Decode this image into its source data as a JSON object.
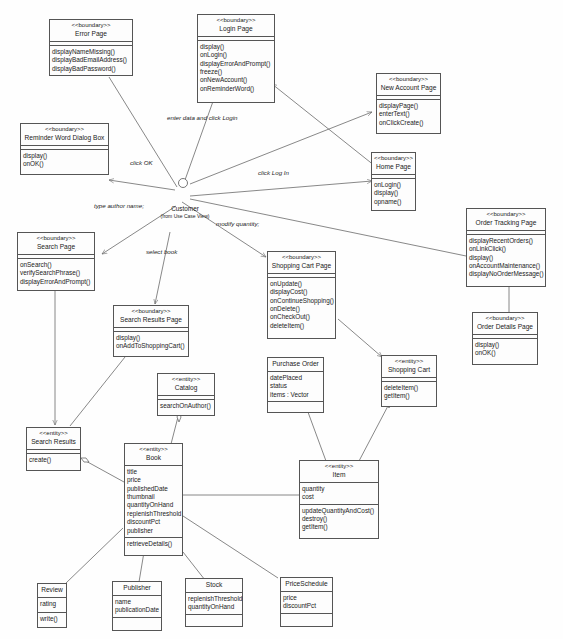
{
  "actor": {
    "name": "Customer",
    "subtitle": "(from Use Case View)"
  },
  "classes": {
    "error_page": {
      "stereotype": "<<boundary>>",
      "name": "Error Page",
      "operations": [
        "displayNameMissing()",
        "displayBadEmailAddress()",
        "displayBadPassword()"
      ]
    },
    "login_page": {
      "stereotype": "<<boundary>>",
      "name": "Login Page",
      "operations": [
        "display()",
        "onLogin()",
        "displayErrorAndPrompt()",
        "freeze()",
        "onNewAccount()",
        "onReminderWord()"
      ]
    },
    "new_account_page": {
      "stereotype": "<<boundary>>",
      "name": "New Account Page",
      "operations": [
        "displayPage()",
        "enterText()",
        "onClickCreate()"
      ]
    },
    "reminder_word_dialog": {
      "stereotype": "<<boundary>>",
      "name": "Reminder Word Dialog Box",
      "operations": [
        "display()",
        "onOK()"
      ]
    },
    "home_page": {
      "stereotype": "<<boundary>>",
      "name": "Home Page",
      "operations": [
        "onLogin()",
        "display()",
        "opname()"
      ]
    },
    "order_tracking_page": {
      "stereotype": "<<boundary>>",
      "name": "Order Tracking Page",
      "operations": [
        "displayRecentOrders()",
        "onLinkClick()",
        "display()",
        "onAccountMaintenance()",
        "displayNoOrderMessage()"
      ]
    },
    "search_page": {
      "stereotype": "<<boundary>>",
      "name": "Search Page",
      "operations": [
        "onSearch()",
        "verifySearchPhrase()",
        "displayErrorAndPrompt()"
      ]
    },
    "shopping_cart_page": {
      "stereotype": "<<boundary>>",
      "name": "Shopping Cart Page",
      "operations": [
        "onUpdate()",
        "displayCost()",
        "onContinueShopping()",
        "onDelete()",
        "onCheckOut()",
        "deleteItem()"
      ]
    },
    "search_results_page": {
      "stereotype": "<<boundary>>",
      "name": "Search Results Page",
      "operations": [
        "display()",
        "onAddToShoppingCart()"
      ]
    },
    "order_details_page": {
      "stereotype": "<<boundary>>",
      "name": "Order Details Page",
      "operations": [
        "display()",
        "onOK()"
      ]
    },
    "catalog": {
      "stereotype": "<<entity>>",
      "name": "Catalog",
      "operations": [
        "searchOnAuthor()"
      ]
    },
    "purchase_order": {
      "name": "Purchase Order",
      "attributes": [
        "datePlaced",
        "status",
        "items : Vector"
      ]
    },
    "shopping_cart": {
      "stereotype": "<<entity>>",
      "name": "Shopping Cart",
      "operations": [
        "deleteItem()",
        "getItem()"
      ]
    },
    "search_results": {
      "stereotype": "<<entity>>",
      "name": "Search Results",
      "operations": [
        "create()"
      ]
    },
    "book": {
      "stereotype": "<<entity>>",
      "name": "Book",
      "attributes": [
        "title",
        "price",
        "publishedDate",
        "thumbnail",
        "quantityOnHand",
        "replenishThreshold",
        "discountPct",
        "publisher"
      ],
      "operations": [
        "retrieveDetails()"
      ]
    },
    "item": {
      "stereotype": "<<entity>>",
      "name": "Item",
      "attributes": [
        "quantity",
        "cost"
      ],
      "operations": [
        "updateQuantityAndCost()",
        "destroy()",
        "getItem()"
      ]
    },
    "review": {
      "name": "Review",
      "attributes": [
        "rating"
      ],
      "operations": [
        "write()"
      ]
    },
    "publisher": {
      "name": "Publisher",
      "attributes": [
        "name",
        "publicationDate"
      ]
    },
    "stock": {
      "name": "Stock",
      "attributes": [
        "replenishThreshold",
        "quantityOnHand"
      ]
    },
    "price_schedule": {
      "name": "PriceSchedule",
      "attributes": [
        "price",
        "discountPct"
      ]
    }
  },
  "labels": {
    "enter_data": "enter data and click Login",
    "click_ok": "click OK",
    "click_log_in": "click Log In",
    "type_author": "type author name;",
    "select_book": "select book",
    "modify_quantity": "modify quantity;"
  },
  "colors": {
    "line": "#6a6a6a",
    "border": "#555555",
    "background": "#fefefe"
  }
}
